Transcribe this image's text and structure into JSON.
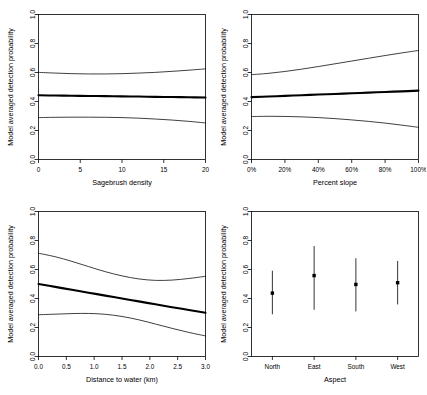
{
  "figure": {
    "ylabel": "Model averaged detection probability",
    "ylim": [
      0.0,
      1.0
    ],
    "yticks": [
      "0.0",
      "0.2",
      "0.4",
      "0.6",
      "0.8",
      "1.0"
    ],
    "ytickvalues": [
      0.0,
      0.2,
      0.4,
      0.6,
      0.8,
      1.0
    ],
    "line_color": "#000000",
    "background": "#ffffff"
  },
  "chart_data": [
    {
      "type": "line",
      "panel": "top-left",
      "title": "",
      "xlabel": "Sagebrush density",
      "ylabel": "Model averaged detection probability",
      "xlim": [
        0,
        20
      ],
      "ylim": [
        0,
        1
      ],
      "xticks": [
        "0",
        "5",
        "10",
        "15",
        "20"
      ],
      "xtickvalues": [
        0,
        5,
        10,
        15,
        20
      ],
      "yticks": [
        "0.0",
        "0.2",
        "0.4",
        "0.6",
        "0.8",
        "1.0"
      ],
      "grid": false,
      "legend": "none",
      "x": [
        0,
        2,
        4,
        6,
        8,
        10,
        12,
        14,
        16,
        18,
        20
      ],
      "series": [
        {
          "name": "Model averaged estimate",
          "style": "thick",
          "values": [
            0.443,
            0.441,
            0.44,
            0.438,
            0.437,
            0.435,
            0.434,
            0.432,
            0.431,
            0.429,
            0.428
          ]
        },
        {
          "name": "Upper 95% confidence limit",
          "style": "thin",
          "values": [
            0.601,
            0.596,
            0.592,
            0.59,
            0.59,
            0.592,
            0.596,
            0.601,
            0.608,
            0.616,
            0.625
          ]
        },
        {
          "name": "Lower 95% confidence limit",
          "style": "thin",
          "values": [
            0.289,
            0.291,
            0.292,
            0.292,
            0.291,
            0.289,
            0.285,
            0.279,
            0.272,
            0.263,
            0.252
          ]
        }
      ]
    },
    {
      "type": "line",
      "panel": "top-right",
      "title": "",
      "xlabel": "Percent slope",
      "ylabel": "Model averaged detection probability",
      "xlim": [
        0,
        100
      ],
      "ylim": [
        0,
        1
      ],
      "xticks": [
        "0%",
        "20%",
        "40%",
        "60%",
        "80%",
        "100%"
      ],
      "xtickvalues": [
        0,
        20,
        40,
        60,
        80,
        100
      ],
      "yticks": [
        "0.0",
        "0.2",
        "0.4",
        "0.6",
        "0.8",
        "1.0"
      ],
      "grid": false,
      "legend": "none",
      "x": [
        0,
        10,
        20,
        30,
        40,
        50,
        60,
        70,
        80,
        90,
        100
      ],
      "series": [
        {
          "name": "Model averaged estimate",
          "style": "thick",
          "values": [
            0.43,
            0.434,
            0.439,
            0.443,
            0.448,
            0.452,
            0.457,
            0.461,
            0.466,
            0.47,
            0.475
          ]
        },
        {
          "name": "Upper 95% confidence limit",
          "style": "thin",
          "values": [
            0.585,
            0.594,
            0.607,
            0.623,
            0.641,
            0.66,
            0.679,
            0.698,
            0.717,
            0.735,
            0.752
          ]
        },
        {
          "name": "Lower 95% confidence limit",
          "style": "thin",
          "values": [
            0.296,
            0.298,
            0.297,
            0.294,
            0.289,
            0.282,
            0.273,
            0.263,
            0.251,
            0.237,
            0.222
          ]
        }
      ]
    },
    {
      "type": "line",
      "panel": "bottom-left",
      "title": "",
      "xlabel": "Distance to water (km)",
      "ylabel": "Model averaged detection probability",
      "xlim": [
        0,
        3
      ],
      "ylim": [
        0,
        1
      ],
      "xticks": [
        "0.0",
        "0.5",
        "1.0",
        "1.5",
        "2.0",
        "2.5",
        "3.0"
      ],
      "xtickvalues": [
        0.0,
        0.5,
        1.0,
        1.5,
        2.0,
        2.5,
        3.0
      ],
      "yticks": [
        "0.0",
        "0.2",
        "0.4",
        "0.6",
        "0.8",
        "1.0"
      ],
      "grid": false,
      "legend": "none",
      "x": [
        0.0,
        0.3,
        0.6,
        0.9,
        1.2,
        1.5,
        1.8,
        2.1,
        2.4,
        2.7,
        3.0
      ],
      "series": [
        {
          "name": "Model averaged estimate",
          "style": "thick",
          "values": [
            0.5,
            0.48,
            0.46,
            0.44,
            0.42,
            0.4,
            0.38,
            0.36,
            0.34,
            0.321,
            0.302
          ]
        },
        {
          "name": "Upper 95% confidence limit",
          "style": "thin",
          "values": [
            0.712,
            0.688,
            0.656,
            0.62,
            0.585,
            0.556,
            0.535,
            0.525,
            0.527,
            0.538,
            0.553
          ]
        },
        {
          "name": "Lower 95% confidence limit",
          "style": "thin",
          "values": [
            0.288,
            0.292,
            0.296,
            0.297,
            0.291,
            0.276,
            0.253,
            0.224,
            0.194,
            0.166,
            0.142
          ]
        }
      ]
    },
    {
      "type": "scatter",
      "panel": "bottom-right",
      "title": "",
      "xlabel": "Aspect",
      "ylabel": "Model averaged detection probability",
      "ylim": [
        0,
        1
      ],
      "yticks": [
        "0.0",
        "0.2",
        "0.4",
        "0.6",
        "0.8",
        "1.0"
      ],
      "grid": false,
      "legend": "none",
      "categories": [
        "North",
        "East",
        "South",
        "West"
      ],
      "values": [
        0.437,
        0.558,
        0.497,
        0.509
      ],
      "errors_upper": [
        0.592,
        0.762,
        0.678,
        0.659
      ],
      "errors_lower": [
        0.291,
        0.322,
        0.311,
        0.359
      ],
      "marker": "filled-square"
    }
  ]
}
